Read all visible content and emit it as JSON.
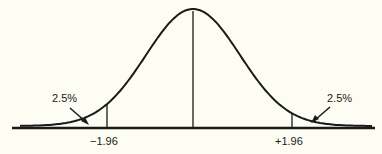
{
  "diagram": {
    "type": "normal-distribution",
    "left_tail_label": "2.5%",
    "right_tail_label": "2.5%",
    "left_critical_value": "−1.96",
    "right_critical_value": "+1.96",
    "colors": {
      "line": "#1a1a1a",
      "background": "#fdfdf3"
    }
  }
}
